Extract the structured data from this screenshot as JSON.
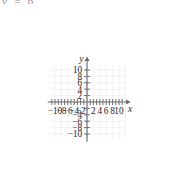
{
  "figure": {
    "title": "",
    "axis_labels": {
      "x": "x",
      "y": "y"
    },
    "top_text_fragment": "y = 6"
  },
  "chart_data": {
    "type": "scatter",
    "title": "",
    "subtitle": "",
    "xlabel": "x",
    "ylabel": "y",
    "xlim": [
      -11.5,
      11.5
    ],
    "ylim": [
      -11.5,
      11.5
    ],
    "grid": true,
    "grid_spacing": 2,
    "grid_color": "#ececed",
    "axis_color": "#6b6b6e",
    "legend": null,
    "legend_position": "none",
    "series": [],
    "x_tick_values": [
      -10,
      -8,
      -6,
      -4,
      -2,
      2,
      4,
      6,
      8,
      10
    ],
    "x_tick_labels": [
      "-10",
      "-8",
      "-6",
      "-4",
      "-2",
      "2",
      "4",
      "6",
      "8",
      "10"
    ],
    "y_tick_values": [
      10,
      8,
      6,
      4,
      2,
      -4,
      -6,
      -8,
      -10
    ],
    "y_tick_labels": [
      "10",
      "8",
      "6",
      "4",
      "2",
      "-4",
      "-6",
      "-8",
      "-10"
    ],
    "x_minor_tick_values": [
      -11,
      -9,
      -7,
      -5,
      -3,
      -1,
      1,
      3,
      5,
      7,
      9,
      11
    ],
    "y_minor_tick_values": [
      -2
    ],
    "annotations": [],
    "arrowheads": [
      "x-positive",
      "y-positive"
    ]
  },
  "ticks": {
    "x": [
      {
        "value": -10,
        "label": "-10"
      },
      {
        "value": -8,
        "label": "-8"
      },
      {
        "value": -6,
        "label": "-6"
      },
      {
        "value": -4,
        "label": "-4"
      },
      {
        "value": -2,
        "label": "-2"
      },
      {
        "value": 2,
        "label": "2"
      },
      {
        "value": 4,
        "label": "4"
      },
      {
        "value": 6,
        "label": "6"
      },
      {
        "value": 8,
        "label": "8"
      },
      {
        "value": 10,
        "label": "10"
      }
    ],
    "y": [
      {
        "value": 10,
        "label": "10"
      },
      {
        "value": 8,
        "label": "8"
      },
      {
        "value": 6,
        "label": "6"
      },
      {
        "value": 4,
        "label": "4"
      },
      {
        "value": 2,
        "label": "2"
      },
      {
        "value": -4,
        "label": "-4"
      },
      {
        "value": -6,
        "label": "-6"
      },
      {
        "value": -8,
        "label": "-8"
      },
      {
        "value": -10,
        "label": "-10"
      }
    ]
  }
}
